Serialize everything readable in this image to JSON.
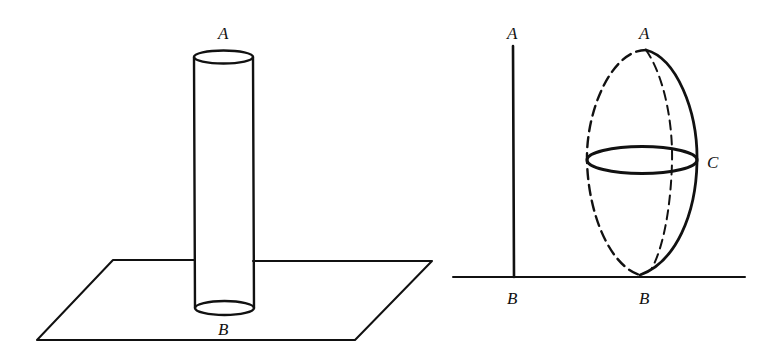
{
  "figure": {
    "colors": {
      "ink": "#111111",
      "background": "#ffffff"
    },
    "left_panel": {
      "description": "vertical cylinder standing on a plane",
      "labels": {
        "top": "A",
        "bottom": "B"
      }
    },
    "right_panel": {
      "description": "vertical line segment AB on a baseline, and an ellipsoid of revolution touching the baseline at B with equator circle through C",
      "line_labels": {
        "top": "A",
        "bottom": "B"
      },
      "ellipsoid_labels": {
        "top": "A",
        "bottom": "B",
        "equator": "C"
      }
    }
  }
}
